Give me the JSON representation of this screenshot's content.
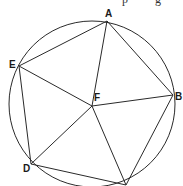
{
  "diagram": {
    "type": "inscribed-pentagon-with-center",
    "circle": {
      "cx": 92,
      "cy": 104,
      "r": 83
    },
    "points": {
      "A": {
        "x": 107,
        "y": 21,
        "label": "A",
        "lx": 105,
        "ly": 17
      },
      "B": {
        "x": 173,
        "y": 95,
        "label": "B",
        "lx": 175,
        "ly": 100
      },
      "C": {
        "x": 126,
        "y": 185,
        "label": "C",
        "lx": 124,
        "ly": 195
      },
      "D": {
        "x": 31,
        "y": 164,
        "label": "D",
        "lx": 23,
        "ly": 172
      },
      "E": {
        "x": 19,
        "y": 66,
        "label": "E",
        "lx": 9,
        "ly": 68
      },
      "F": {
        "x": 92,
        "y": 106,
        "label": "F",
        "lx": 94,
        "ly": 101
      }
    },
    "pentagon_edges": [
      [
        "A",
        "B"
      ],
      [
        "B",
        "C"
      ],
      [
        "C",
        "D"
      ],
      [
        "D",
        "E"
      ],
      [
        "E",
        "A"
      ]
    ],
    "spokes": [
      [
        "F",
        "A"
      ],
      [
        "F",
        "B"
      ],
      [
        "F",
        "C"
      ],
      [
        "F",
        "D"
      ],
      [
        "F",
        "E"
      ]
    ],
    "clipped_top_text": "p g"
  },
  "labels": {
    "A": "A",
    "B": "B",
    "C": "C",
    "D": "D",
    "E": "E",
    "F": "F"
  }
}
